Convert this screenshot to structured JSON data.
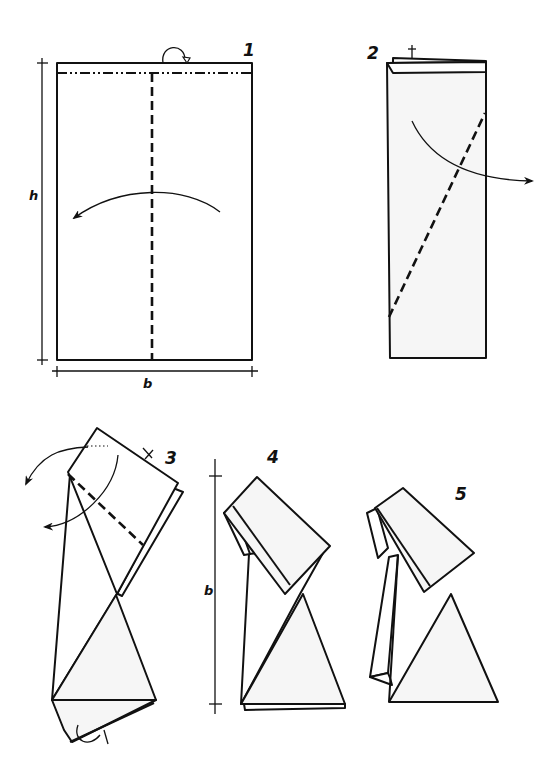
{
  "diagram": {
    "type": "origami-instructions",
    "steps": [
      {
        "number": "1",
        "dimension_labels": {
          "height": "h",
          "width": "b"
        },
        "folds": [
          "mountain fold top strip behind",
          "valley fold vertical center line"
        ],
        "arrows": [
          "fold left to right over center (curved arrow pointing left)",
          "turn-over arrow at top"
        ]
      },
      {
        "number": "2",
        "dimension_labels": {},
        "folds": [
          "valley fold diagonal from lower-left to upper-right"
        ],
        "arrows": [
          "fold over to the right"
        ]
      },
      {
        "number": "3",
        "dimension_labels": {},
        "folds": [
          "valley fold across top flap",
          "mountain fold across bottom"
        ],
        "arrows": [
          "fold top flap back (two curved arrows pointing left)",
          "fold bottom behind"
        ]
      },
      {
        "number": "4",
        "dimension_labels": {
          "height": "b"
        },
        "folds": [],
        "arrows": []
      },
      {
        "number": "5",
        "dimension_labels": {},
        "folds": [],
        "arrows": []
      }
    ],
    "colors": {
      "line": "#111111",
      "paper_fill": "#f6f6f6",
      "background": "#ffffff"
    }
  }
}
